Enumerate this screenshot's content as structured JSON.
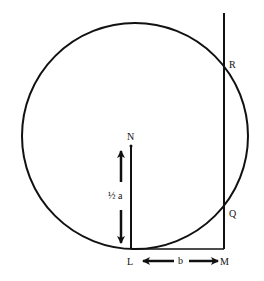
{
  "labels": {
    "N": "N",
    "L": "L",
    "M": "M",
    "Q": "Q",
    "R": "R",
    "half_a": "½ a",
    "b": "b"
  },
  "geometry": {
    "circle": {
      "cx": 135,
      "cy": 136,
      "r": 113
    },
    "points": {
      "N": [
        131,
        146
      ],
      "L": [
        131,
        249
      ],
      "M": [
        224,
        249
      ],
      "Q": [
        224,
        219
      ],
      "R": [
        224,
        53
      ]
    },
    "vertical_line_top": [
      224,
      13
    ]
  },
  "colors": {
    "stroke": "#111111",
    "background": "#ffffff"
  }
}
